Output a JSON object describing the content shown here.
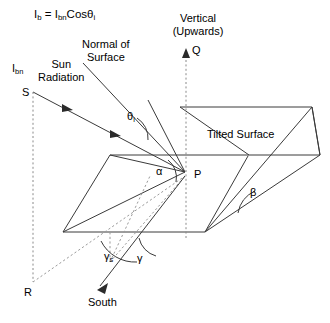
{
  "figure": {
    "type": "diagram",
    "colors": {
      "background": "#ffffff",
      "stroke": "#3a3a3a",
      "dashed_stroke": "#8a8a8a",
      "text": "#000000"
    }
  },
  "equation": {
    "lhs": "I",
    "lhs_sub": "b",
    "eq": " = ",
    "rhs": "I",
    "rhs_sub": "bn",
    "func": "Cos",
    "angle": "θ",
    "angle_sub": "i",
    "full": "Ib = Ibn Cosθi"
  },
  "labels": {
    "normal_of_surface_line1": "Normal of",
    "normal_of_surface_line2": "Surface",
    "vertical_line1": "Vertical",
    "vertical_line2": "(Upwards)",
    "sun_line1": "Sun",
    "sun_line2": "Radiation",
    "tilted_surface": "Tilted Surface",
    "south": "South",
    "incident_beam": "I",
    "incident_beam_sub": "bn"
  },
  "points": {
    "S": "S",
    "Q": "Q",
    "P": "P",
    "R": "R"
  },
  "angles": {
    "theta_i": "θ",
    "theta_i_sub": "i",
    "alpha": "α",
    "beta": "β",
    "gamma_s": "γ",
    "gamma_s_sub": "s",
    "gamma": "γ"
  }
}
